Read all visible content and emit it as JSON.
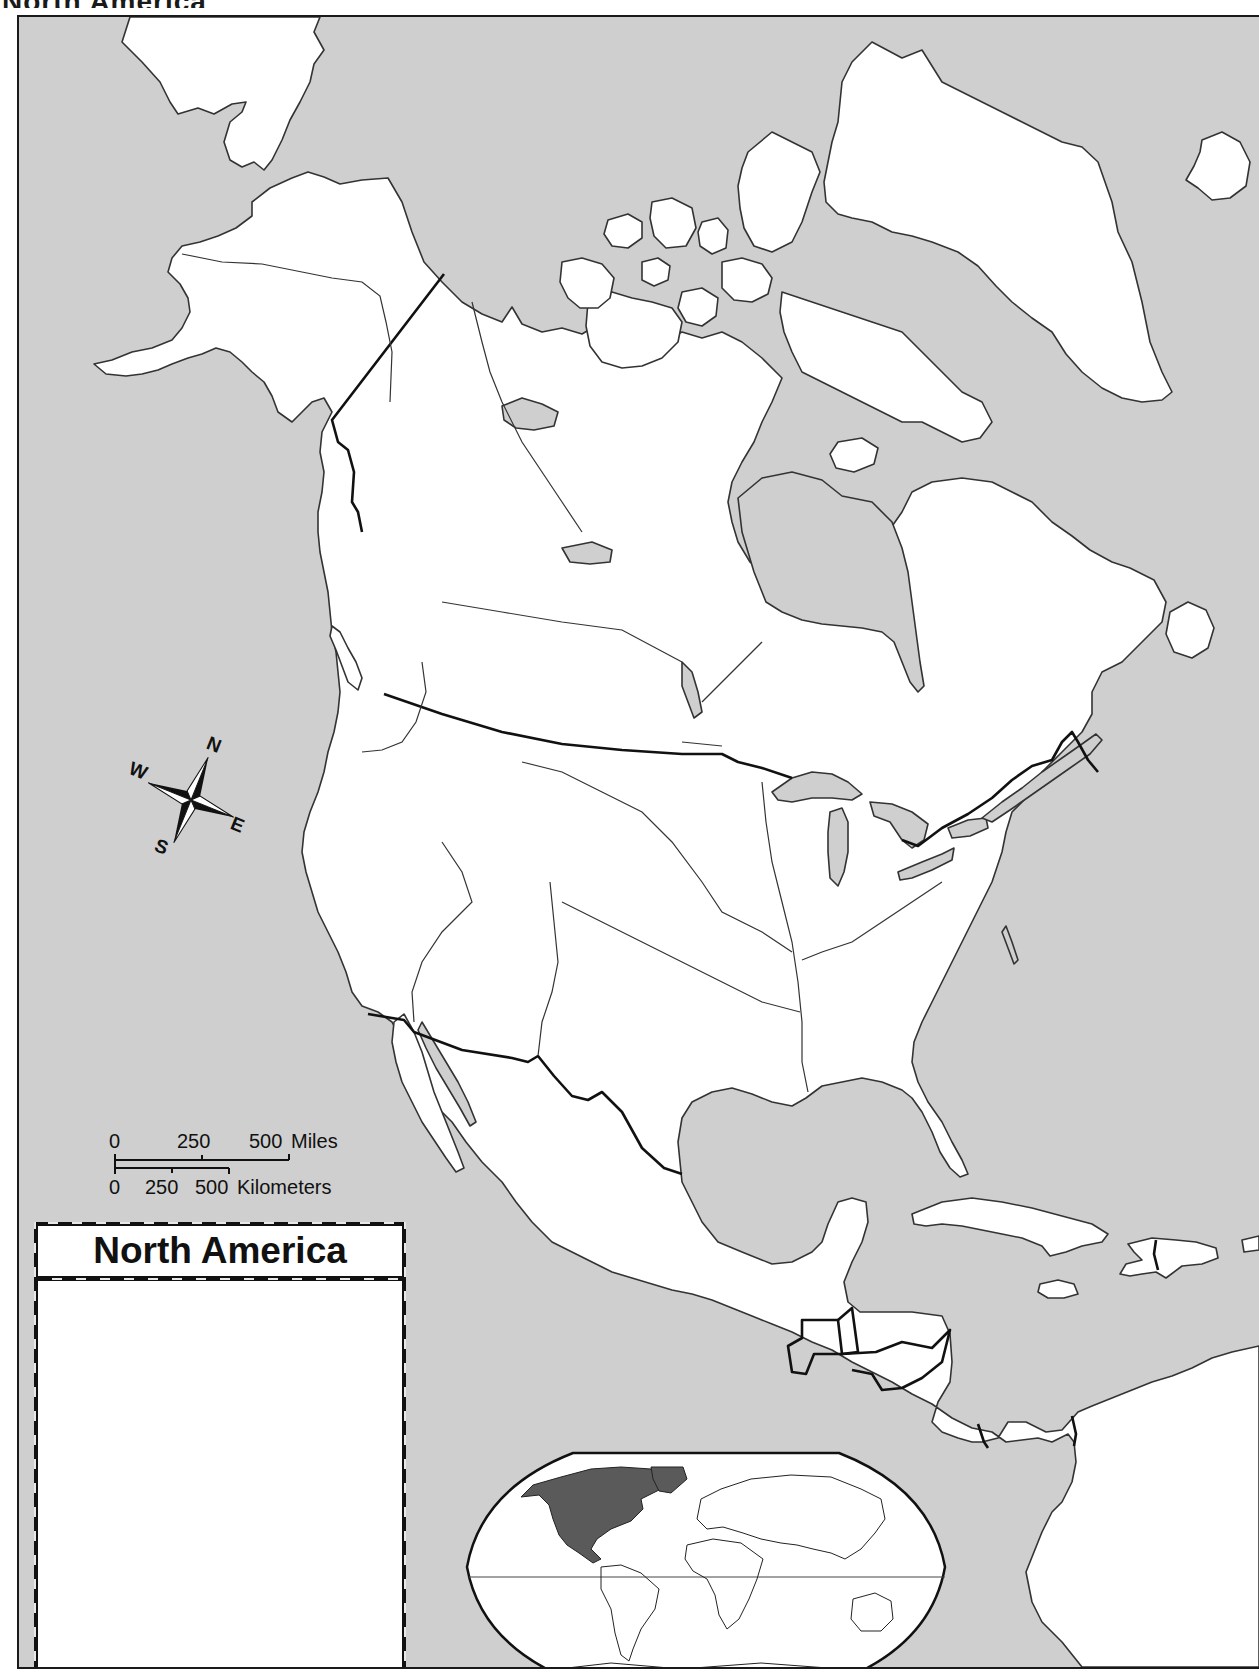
{
  "page": {
    "cut_title": "North America"
  },
  "map": {
    "title": "North America",
    "colors": {
      "water": "#cfcfcf",
      "land": "#ffffff",
      "coastline": "#333333",
      "border": "#111111",
      "inset_highlight": "#5a5a5a"
    },
    "compass": {
      "north": "N",
      "south": "S",
      "east": "E",
      "west": "W"
    },
    "scale_bar": {
      "miles": {
        "ticks": [
          "0",
          "250",
          "500"
        ],
        "unit": "Miles"
      },
      "kilometers": {
        "ticks": [
          "0",
          "250",
          "500"
        ],
        "unit": "Kilometers"
      }
    },
    "title_box": {
      "heading": "North America",
      "body_text": ""
    },
    "inset": {
      "type": "world-locator",
      "highlighted_region": "North America"
    }
  }
}
